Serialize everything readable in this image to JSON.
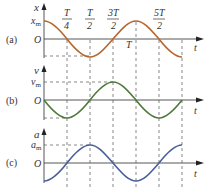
{
  "figure": {
    "panels": [
      {
        "id": "a",
        "tag": "(a)",
        "ylabel": "x",
        "amp_label": "x",
        "amp_sub": "m",
        "origin": "O",
        "xlabel": "t",
        "curve": "cosine",
        "color": "#b5652e"
      },
      {
        "id": "b",
        "tag": "(b)",
        "ylabel": "v",
        "amp_label": "v",
        "amp_sub": "m",
        "origin": "O",
        "xlabel": "t",
        "curve": "negative sine",
        "color": "#4e7a3a"
      },
      {
        "id": "c",
        "tag": "(c)",
        "ylabel": "a",
        "amp_label": "a",
        "amp_sub": "m",
        "origin": "O",
        "xlabel": "t",
        "curve": "negative cosine",
        "color": "#4a5f9a"
      }
    ],
    "time_marks": [
      {
        "num": "T",
        "den": "4"
      },
      {
        "num": "T",
        "den": "2"
      },
      {
        "num": "3T",
        "den": "2"
      },
      {
        "label": "T"
      },
      {
        "num": "5T",
        "den": "2"
      }
    ]
  }
}
